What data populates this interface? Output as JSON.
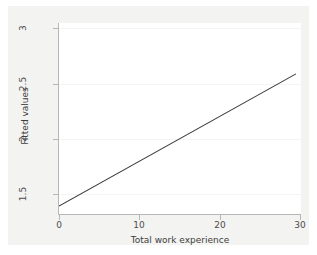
{
  "chart_data": {
    "type": "line",
    "title": "",
    "xlabel": "Total work experience",
    "ylabel": "Fitted values",
    "xlim": [
      0,
      30
    ],
    "ylim": [
      1.36,
      3.05
    ],
    "xticks": [
      0,
      10,
      20,
      30
    ],
    "xtick_labels": [
      "0",
      "10",
      "20",
      "30"
    ],
    "yticks": [
      1.5,
      2,
      2.5,
      3
    ],
    "ytick_labels": [
      "1.5",
      "2",
      "2.5",
      "3"
    ],
    "grid": "horizontal",
    "legend": "none",
    "series": [
      {
        "name": "Fitted values",
        "color": "#3a3a3a",
        "x": [
          0,
          29.5
        ],
        "values": [
          1.43,
          2.6
        ]
      }
    ]
  },
  "axes": {
    "y_title": "Fitted values",
    "x_title": "Total work experience",
    "y_tick_labels": [
      "3",
      "2.5",
      "2",
      "1.5"
    ],
    "x_tick_labels": [
      "0",
      "10",
      "20",
      "30"
    ]
  },
  "colors": {
    "graph_region": "#f3f3f1",
    "plot_region": "#ffffff",
    "line": "#3a3a3a",
    "axis": "#b7b7b5",
    "grid": "#f4f4f2",
    "tick_text": "#4d4d4d",
    "title_text": "#3d3d3d"
  }
}
